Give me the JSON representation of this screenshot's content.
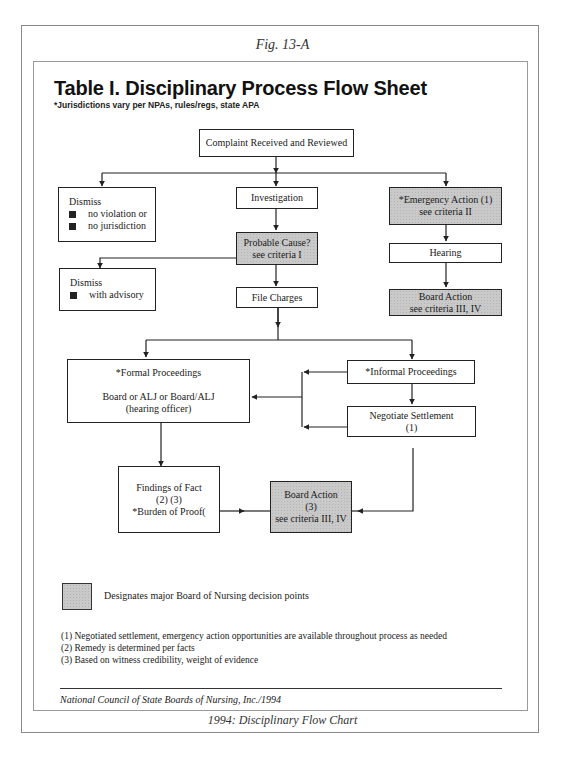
{
  "figure_label": "Fig. 13-A",
  "title": "Table I.  Disciplinary Process Flow Sheet",
  "subtitle": "*Jurisdictions vary per NPAs, rules/regs, state APA",
  "nodes": {
    "complaint": {
      "lines": [
        "Complaint Received and Reviewed"
      ]
    },
    "dismiss1": {
      "heading": "Dismiss",
      "bullets": [
        "no violation or",
        "no jurisdiction"
      ]
    },
    "investigation": {
      "lines": [
        "Investigation"
      ]
    },
    "emergency": {
      "lines": [
        "*Emergency Action (1)",
        "see criteria II"
      ]
    },
    "probable_cause": {
      "lines": [
        "Probable Cause?",
        "see criteria I"
      ]
    },
    "hearing": {
      "lines": [
        "Hearing"
      ]
    },
    "dismiss2": {
      "heading": "Dismiss",
      "bullets": [
        "with advisory"
      ]
    },
    "file_charges": {
      "lines": [
        "File Charges"
      ]
    },
    "board_action1": {
      "lines": [
        "Board Action",
        "see criteria III, IV"
      ]
    },
    "formal": {
      "lines": [
        "*Formal Proceedings",
        "",
        "Board or ALJ or Board/ALJ",
        "(hearing officer)"
      ]
    },
    "informal": {
      "lines": [
        "*Informal Proceedings"
      ]
    },
    "negotiate": {
      "lines": [
        "Negotiate Settlement",
        "(1)"
      ]
    },
    "findings": {
      "lines": [
        "Findings of Fact",
        "(2) (3)",
        "*Burden of Proof("
      ]
    },
    "board_action2": {
      "lines": [
        "Board Action",
        "(3)",
        "see criteria III, IV"
      ]
    }
  },
  "legend": {
    "text": "Designates major Board of Nursing decision points",
    "color": "#c9c9c9"
  },
  "footnotes": [
    "(1) Negotiated settlement, emergency action opportunities are available throughout process as needed",
    "(2) Remedy is determined per facts",
    "(3) Based on witness credibility, weight of evidence"
  ],
  "credit": "National Council of State Boards of Nursing, Inc./1994",
  "caption": "1994: Disciplinary Flow Chart"
}
